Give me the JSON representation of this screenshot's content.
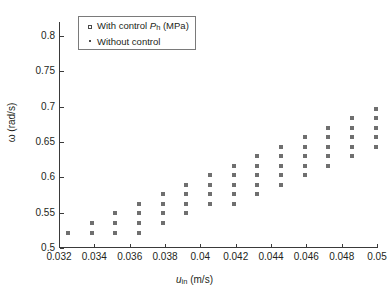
{
  "chart_data": {
    "type": "scatter",
    "title": "",
    "xlabel": "u_in (m/s)",
    "ylabel": "ω (rad/s)",
    "xlim": [
      0.032,
      0.05
    ],
    "ylim": [
      0.5,
      0.82
    ],
    "grid": false,
    "legend_position": "top-left",
    "x_ticks": [
      0.032,
      0.034,
      0.036,
      0.038,
      0.04,
      0.042,
      0.044,
      0.046,
      0.048,
      0.05
    ],
    "x_tick_labels": [
      "0.032",
      "0.034",
      "0.036",
      "0.038",
      "0.04",
      "0.042",
      "0.044",
      "0.046",
      "0.048",
      "0.05"
    ],
    "y_ticks": [
      0.5,
      0.55,
      0.6,
      0.65,
      0.7,
      0.75,
      0.8
    ],
    "y_tick_labels": [
      "0.5",
      "0.55",
      "0.6",
      "0.65",
      "0.7",
      "0.75",
      "0.8"
    ],
    "series": [
      {
        "name": "With control P_h (MPa)",
        "marker": "square",
        "color": "#6f6f6f",
        "points": [
          [
            0.0325,
            0.522
          ],
          [
            0.03384,
            0.522
          ],
          [
            0.03384,
            0.5355
          ],
          [
            0.03518,
            0.522
          ],
          [
            0.03518,
            0.5355
          ],
          [
            0.03518,
            0.549
          ],
          [
            0.03652,
            0.522
          ],
          [
            0.03652,
            0.5355
          ],
          [
            0.03652,
            0.549
          ],
          [
            0.03652,
            0.5625
          ],
          [
            0.03786,
            0.5355
          ],
          [
            0.03786,
            0.549
          ],
          [
            0.03786,
            0.5625
          ],
          [
            0.03786,
            0.576
          ],
          [
            0.0392,
            0.549
          ],
          [
            0.0392,
            0.5625
          ],
          [
            0.0392,
            0.576
          ],
          [
            0.0392,
            0.5895
          ],
          [
            0.04054,
            0.5625
          ],
          [
            0.04054,
            0.576
          ],
          [
            0.04054,
            0.5895
          ],
          [
            0.04054,
            0.603
          ],
          [
            0.04188,
            0.5625
          ],
          [
            0.04188,
            0.576
          ],
          [
            0.04188,
            0.5895
          ],
          [
            0.04188,
            0.603
          ],
          [
            0.04188,
            0.6165
          ],
          [
            0.04322,
            0.576
          ],
          [
            0.04322,
            0.5895
          ],
          [
            0.04322,
            0.603
          ],
          [
            0.04322,
            0.6165
          ],
          [
            0.04322,
            0.63
          ],
          [
            0.04456,
            0.5895
          ],
          [
            0.04456,
            0.603
          ],
          [
            0.04456,
            0.6165
          ],
          [
            0.04456,
            0.63
          ],
          [
            0.04456,
            0.6435
          ],
          [
            0.0459,
            0.603
          ],
          [
            0.0459,
            0.6165
          ],
          [
            0.0459,
            0.63
          ],
          [
            0.0459,
            0.6435
          ],
          [
            0.0459,
            0.657
          ],
          [
            0.04724,
            0.6165
          ],
          [
            0.04724,
            0.63
          ],
          [
            0.04724,
            0.6435
          ],
          [
            0.04724,
            0.657
          ],
          [
            0.04724,
            0.6705
          ],
          [
            0.04858,
            0.63
          ],
          [
            0.04858,
            0.6435
          ],
          [
            0.04858,
            0.657
          ],
          [
            0.04858,
            0.6705
          ],
          [
            0.04858,
            0.684
          ],
          [
            0.04992,
            0.6435
          ],
          [
            0.04992,
            0.657
          ],
          [
            0.04992,
            0.6705
          ],
          [
            0.04992,
            0.684
          ],
          [
            0.04992,
            0.6975
          ],
          [
            0.05126,
            0.657
          ],
          [
            0.05126,
            0.6705
          ],
          [
            0.05126,
            0.684
          ],
          [
            0.05126,
            0.6975
          ],
          [
            0.05126,
            0.711
          ],
          [
            0.0526,
            0.6705
          ],
          [
            0.0526,
            0.684
          ],
          [
            0.0526,
            0.6975
          ],
          [
            0.0526,
            0.711
          ],
          [
            0.0526,
            0.7245
          ],
          [
            0.05394,
            0.684
          ],
          [
            0.05394,
            0.6975
          ],
          [
            0.05394,
            0.711
          ],
          [
            0.05394,
            0.7245
          ],
          [
            0.05394,
            0.738
          ],
          [
            0.05528,
            0.6975
          ],
          [
            0.05528,
            0.711
          ],
          [
            0.05528,
            0.7245
          ],
          [
            0.05528,
            0.738
          ],
          [
            0.05528,
            0.7515
          ],
          [
            0.05662,
            0.711
          ],
          [
            0.05662,
            0.7245
          ],
          [
            0.05662,
            0.738
          ],
          [
            0.05662,
            0.7515
          ],
          [
            0.05662,
            0.765
          ],
          [
            0.05796,
            0.7245
          ],
          [
            0.05796,
            0.738
          ],
          [
            0.05796,
            0.7515
          ],
          [
            0.05796,
            0.765
          ],
          [
            0.05796,
            0.7785
          ],
          [
            0.0593,
            0.738
          ],
          [
            0.0593,
            0.7515
          ],
          [
            0.0593,
            0.765
          ],
          [
            0.0593,
            0.7785
          ],
          [
            0.0593,
            0.792
          ],
          [
            0.06064,
            0.7515
          ],
          [
            0.06064,
            0.765
          ],
          [
            0.06064,
            0.7785
          ],
          [
            0.06064,
            0.792
          ],
          [
            0.06064,
            0.803
          ]
        ]
      },
      {
        "name": "Without control",
        "marker": "dot",
        "color": "#4a4a4a",
        "points": []
      }
    ]
  },
  "legend": {
    "entries": [
      {
        "symbol": "open-square",
        "text_pre": "With control ",
        "text_var": "P",
        "text_sub": "h",
        "text_post": " (MPa)"
      },
      {
        "symbol": "small-dot",
        "text_pre": "Without control",
        "text_var": "",
        "text_sub": "",
        "text_post": ""
      }
    ]
  },
  "axes": {
    "x_title_var": "u",
    "x_title_sub": "in",
    "x_title_unit": " (m/s)",
    "y_title": "ω (rad/s)"
  }
}
